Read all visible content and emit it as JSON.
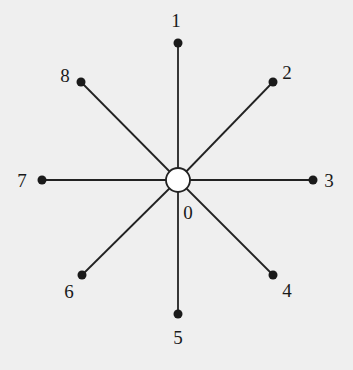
{
  "diagram": {
    "type": "star graph",
    "center": {
      "label": "0",
      "x": 178,
      "y": 180,
      "r": 12,
      "label_x": 188,
      "label_y": 219
    },
    "nodes": [
      {
        "label": "1",
        "x": 178,
        "y": 43,
        "label_x": 176,
        "label_y": 27
      },
      {
        "label": "2",
        "x": 273,
        "y": 82,
        "label_x": 287,
        "label_y": 79
      },
      {
        "label": "3",
        "x": 313,
        "y": 180,
        "label_x": 329,
        "label_y": 187
      },
      {
        "label": "4",
        "x": 273,
        "y": 275,
        "label_x": 287,
        "label_y": 297
      },
      {
        "label": "5",
        "x": 178,
        "y": 314,
        "label_x": 178,
        "label_y": 344
      },
      {
        "label": "6",
        "x": 82,
        "y": 275,
        "label_x": 69,
        "label_y": 298
      },
      {
        "label": "7",
        "x": 42,
        "y": 180,
        "label_x": 22,
        "label_y": 187
      },
      {
        "label": "8",
        "x": 81,
        "y": 82,
        "label_x": 65,
        "label_y": 82
      }
    ]
  }
}
